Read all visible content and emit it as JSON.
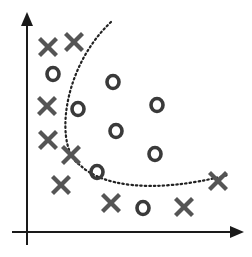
{
  "diagram": {
    "title": "",
    "colors": {
      "axis": "#1a1a1a",
      "x_marker": "#555555",
      "o_marker": "#3a3a3a",
      "boundary": "#222222",
      "background": "#ffffff"
    },
    "axes": {
      "origin": [
        27,
        232
      ],
      "y_top": [
        27,
        14
      ],
      "x_right": [
        242,
        232
      ]
    },
    "boundary": {
      "style": "dotted",
      "path": "M 111 22 C 60 70, 55 150, 80 165 C 100 185, 150 195, 228 175"
    },
    "x_points": [
      {
        "label": "X",
        "x": 48,
        "y": 47
      },
      {
        "label": "X",
        "x": 74,
        "y": 42
      },
      {
        "label": "X",
        "x": 47,
        "y": 106
      },
      {
        "label": "X",
        "x": 48,
        "y": 140
      },
      {
        "label": "X",
        "x": 71,
        "y": 155
      },
      {
        "label": "X",
        "x": 61,
        "y": 185
      },
      {
        "label": "X",
        "x": 111,
        "y": 203
      },
      {
        "label": "X",
        "x": 184,
        "y": 207
      },
      {
        "label": "X",
        "x": 218,
        "y": 181
      }
    ],
    "o_points": [
      {
        "label": "O",
        "x": 53,
        "y": 74
      },
      {
        "label": "O",
        "x": 78,
        "y": 109
      },
      {
        "label": "O",
        "x": 113,
        "y": 82
      },
      {
        "label": "O",
        "x": 157,
        "y": 105
      },
      {
        "label": "O",
        "x": 116,
        "y": 131
      },
      {
        "label": "O",
        "x": 155,
        "y": 154
      },
      {
        "label": "O",
        "x": 97,
        "y": 172
      },
      {
        "label": "O",
        "x": 143,
        "y": 208
      }
    ]
  }
}
